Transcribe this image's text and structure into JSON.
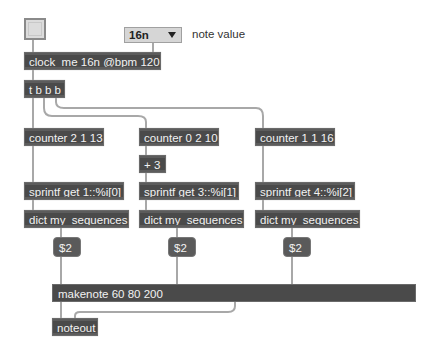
{
  "patcher": {
    "toggle": {
      "state": "off"
    },
    "note_value_menu": {
      "selected": "16n",
      "label": "note value"
    },
    "objects": {
      "clock": "clock_me 16n @bpm 120",
      "trigger": "t b b b",
      "counter1": "counter 2 1 13",
      "counter2": "counter 0 2 10",
      "counter3": "counter 1 1 16",
      "plus": "+ 3",
      "sprintf1": "sprintf get 1::%i[0]",
      "sprintf2": "sprintf get 3::%i[1]",
      "sprintf3": "sprintf get 4::%i[2]",
      "dict1": "dict my_sequences",
      "dict2": "dict my_sequences",
      "dict3": "dict my_sequences",
      "makenote": "makenote 60 80 200",
      "noteout": "noteout"
    },
    "messages": {
      "msg1": "$2",
      "msg2": "$2",
      "msg3": "$2"
    }
  },
  "colors": {
    "object_bg": "#4a4a4a",
    "object_text": "#f2f2f2",
    "cord": "#a8a8a8",
    "background": "#ffffff"
  }
}
